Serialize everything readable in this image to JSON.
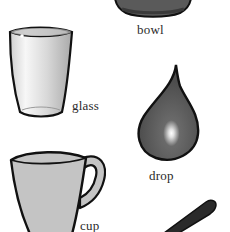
{
  "page": {
    "type": "picture-dictionary-illustration"
  },
  "items": [
    {
      "id": "bowl",
      "label": "bowl",
      "icon": "bowl-icon"
    },
    {
      "id": "glass",
      "label": "glass",
      "icon": "glass-icon"
    },
    {
      "id": "drop",
      "label": "drop",
      "icon": "drop-icon"
    },
    {
      "id": "cup",
      "label": "cup",
      "icon": "cup-icon"
    },
    {
      "id": "spoon",
      "label": "",
      "icon": "spoon-handle-icon"
    }
  ],
  "colors": {
    "outline": "#111111",
    "bowl_fill": "#5a5a5a",
    "bowl_band": "#3c3c3c",
    "glass_fill": "#e6e6e6",
    "drop_fill": "#555555",
    "cup_fill": "#c4c4c4",
    "spoon_fill": "#2a2a2a",
    "label_text": "#2a2a2a"
  }
}
